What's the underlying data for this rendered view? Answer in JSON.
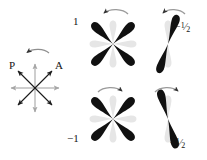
{
  "figure": {
    "background": "#ffffff",
    "ink": "#111111",
    "ghost": "#e3e3e3",
    "axis": "#9a9a9a"
  },
  "key_diagram": {
    "name": "polarizer-analyzer-star",
    "labels": {
      "polarizer": "P",
      "analyzer": "A"
    },
    "rotation": "counterclockwise",
    "arrow_count": 8,
    "dark_arrow_angles_deg": [
      45,
      135,
      225,
      315
    ],
    "light_arrow_angles_deg": [
      0,
      90,
      180,
      270
    ]
  },
  "panels": [
    {
      "id": "top-left",
      "value_label": "1",
      "value_is_fraction": false,
      "numerator": "",
      "denominator": "",
      "rotation": "counterclockwise",
      "pattern": "four-petal",
      "dark_petal_angles_deg": [
        45,
        135,
        225,
        315
      ],
      "ghost_petal_angles_deg": [
        0,
        90,
        180,
        270
      ]
    },
    {
      "id": "top-right",
      "value_label": "-1/2",
      "value_is_fraction": true,
      "sign": "−",
      "numerator": "1",
      "denominator": "2",
      "rotation": "counterclockwise",
      "pattern": "two-petal",
      "dark_petal_angles_deg": [
        105,
        285
      ],
      "ghost_petal_angles_deg": [
        90,
        270
      ]
    },
    {
      "id": "bottom-left",
      "value_label": "-1",
      "value_is_fraction": false,
      "sign": "−",
      "numerator": "1",
      "denominator": "",
      "rotation": "clockwise",
      "pattern": "four-petal",
      "dark_petal_angles_deg": [
        45,
        135,
        225,
        315
      ],
      "ghost_petal_angles_deg": [
        0,
        90,
        180,
        270
      ]
    },
    {
      "id": "bottom-right",
      "value_label": "-1/2",
      "value_is_fraction": true,
      "sign": "−",
      "numerator": "1",
      "denominator": "2",
      "rotation": "clockwise",
      "pattern": "two-petal",
      "dark_petal_angles_deg": [
        75,
        255
      ],
      "ghost_petal_angles_deg": [
        90,
        270
      ]
    }
  ]
}
